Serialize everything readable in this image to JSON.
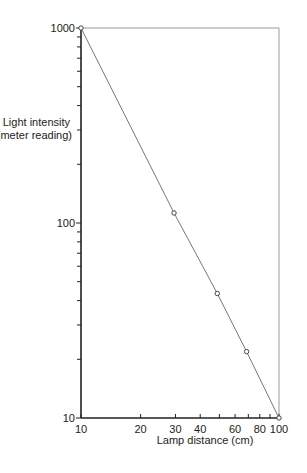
{
  "chart_data": {
    "type": "line",
    "title": "",
    "xlabel": "Lamp distance (cm)",
    "ylabel": "Light intensity (meter reading)",
    "ylabel_lines": [
      "Light intensity",
      "(meter reading)"
    ],
    "xscale": "log",
    "yscale": "log",
    "xlim": [
      10,
      100
    ],
    "ylim": [
      10,
      1000
    ],
    "x_tick_labels": [
      "10",
      "20",
      "30",
      "40",
      "60",
      "80",
      "100"
    ],
    "x_tick_values": [
      10,
      20,
      30,
      40,
      60,
      80,
      100
    ],
    "x_minor_ticks": [
      50,
      70,
      90
    ],
    "y_tick_labels": [
      "10",
      "100",
      "1000"
    ],
    "y_tick_values": [
      10,
      100,
      1000
    ],
    "y_minor_ticks": [
      20,
      30,
      40,
      50,
      60,
      70,
      80,
      90,
      200,
      300,
      400,
      500,
      600,
      700,
      800,
      900
    ],
    "grid": false,
    "series": [
      {
        "name": "Measured",
        "marker": "open-circle",
        "x": [
          10,
          29.5,
          48.8,
          68.6,
          100
        ],
        "y": [
          1000,
          112.6,
          43.5,
          21.9,
          10
        ]
      }
    ]
  },
  "labels": {
    "ylabel_line1": "Light intensity",
    "ylabel_line2": "(meter reading)",
    "xlabel": "Lamp distance (cm)"
  }
}
